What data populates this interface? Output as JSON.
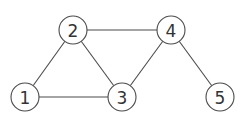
{
  "graph": {
    "node_radius": 14,
    "colors": {
      "stroke": "#4a4a4a",
      "fill": "#ffffff",
      "text": "#333333",
      "background": "#ffffff"
    },
    "nodes": [
      {
        "id": "1",
        "label": "1",
        "x": 25,
        "y": 97
      },
      {
        "id": "2",
        "label": "2",
        "x": 73,
        "y": 30
      },
      {
        "id": "3",
        "label": "3",
        "x": 122,
        "y": 97
      },
      {
        "id": "4",
        "label": "4",
        "x": 171,
        "y": 30
      },
      {
        "id": "5",
        "label": "5",
        "x": 220,
        "y": 97
      }
    ],
    "edges": [
      {
        "from": "1",
        "to": "2"
      },
      {
        "from": "1",
        "to": "3"
      },
      {
        "from": "2",
        "to": "3"
      },
      {
        "from": "2",
        "to": "4"
      },
      {
        "from": "3",
        "to": "4"
      },
      {
        "from": "4",
        "to": "5"
      }
    ]
  }
}
